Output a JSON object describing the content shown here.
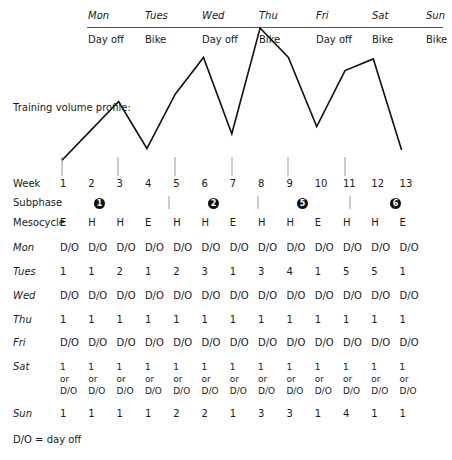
{
  "header": {
    "days": [
      "Mon",
      "Tues",
      "Wed",
      "Thu",
      "Fri",
      "Sat",
      "Sun"
    ],
    "activities": [
      "Day off",
      "Bike",
      "Day off",
      "Bike",
      "Day off",
      "Bike",
      "Bike"
    ]
  },
  "chart_label": "Training volume profile:",
  "chart_data": {
    "type": "line",
    "title": "Training volume profile:",
    "x": [
      1,
      2,
      3,
      4,
      5,
      6,
      7,
      8,
      9,
      10,
      11,
      12,
      13
    ],
    "values": [
      1,
      3,
      5,
      1.8,
      5.5,
      8,
      2.8,
      10,
      8,
      3.3,
      7.1,
      7.9,
      1.7
    ],
    "xlabel": "Week",
    "ylabel": "",
    "grid": false
  },
  "rows": {
    "week_label": "Week",
    "weeks": [
      "1",
      "2",
      "3",
      "4",
      "5",
      "6",
      "7",
      "8",
      "9",
      "10",
      "11",
      "12",
      "13"
    ],
    "subphase_label": "Subphase",
    "subphases": [
      "1",
      "2",
      "5",
      "6"
    ],
    "mesocycle_label": "Mesocycle",
    "mesocycle": [
      "E",
      "H",
      "H",
      "E",
      "H",
      "H",
      "E",
      "H",
      "H",
      "E",
      "H",
      "H",
      "E"
    ],
    "mon_label": "Mon",
    "mon": [
      "D/O",
      "D/O",
      "D/O",
      "D/O",
      "D/O",
      "D/O",
      "D/O",
      "D/O",
      "D/O",
      "D/O",
      "D/O",
      "D/O",
      "D/O"
    ],
    "tues_label": "Tues",
    "tues": [
      "1",
      "1",
      "2",
      "1",
      "2",
      "3",
      "1",
      "3",
      "4",
      "1",
      "5",
      "5",
      "1"
    ],
    "wed_label": "Wed",
    "wed": [
      "D/O",
      "D/O",
      "D/O",
      "D/O",
      "D/O",
      "D/O",
      "D/O",
      "D/O",
      "D/O",
      "D/O",
      "D/O",
      "D/O",
      "D/O"
    ],
    "thu_label": "Thu",
    "thu": [
      "1",
      "1",
      "1",
      "1",
      "1",
      "1",
      "1",
      "1",
      "1",
      "1",
      "1",
      "1",
      "1"
    ],
    "fri_label": "Fri",
    "fri": [
      "D/O",
      "D/O",
      "D/O",
      "D/O",
      "D/O",
      "D/O",
      "D/O",
      "D/O",
      "D/O",
      "D/O",
      "D/O",
      "D/O",
      "D/O"
    ],
    "sat_label": "Sat",
    "sat": {
      "line1": "1",
      "line2": "or",
      "line3": "D/O"
    },
    "sun_label": "Sun",
    "sun": [
      "1",
      "1",
      "1",
      "1",
      "2",
      "2",
      "1",
      "3",
      "3",
      "1",
      "4",
      "1",
      "1"
    ]
  },
  "footnote": "D/O = day off"
}
